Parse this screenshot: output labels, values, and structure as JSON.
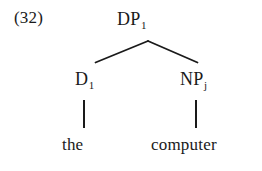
{
  "figure": {
    "example_number": "(32)",
    "type": "syntax-tree",
    "ink_color": "#1a1a1a",
    "background_color": "#ffffff"
  },
  "tree": {
    "root": {
      "label": "DP",
      "subscript": "1"
    },
    "left_child": {
      "label": "D",
      "subscript": "1",
      "terminal": "the"
    },
    "right_child": {
      "label": "NP",
      "subscript": "j",
      "terminal": "computer"
    }
  }
}
